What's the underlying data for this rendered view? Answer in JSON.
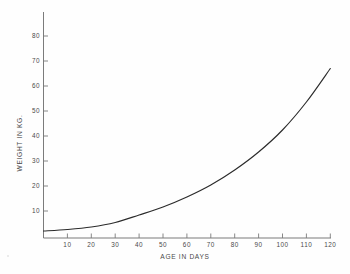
{
  "chart_data": {
    "type": "line",
    "title": "",
    "subtitle": "",
    "xlabel": "AGE IN DAYS",
    "ylabel": "WEIGHT IN KG.",
    "xlim": [
      0,
      125
    ],
    "ylim": [
      0,
      85
    ],
    "xticks": [
      10,
      20,
      30,
      40,
      50,
      60,
      70,
      80,
      90,
      100,
      110,
      120
    ],
    "yticks": [
      10,
      20,
      30,
      40,
      50,
      60,
      70,
      80
    ],
    "xtick_labels": [
      "10",
      "20",
      "30",
      "40",
      "50",
      "60",
      "70",
      "80",
      "90",
      "100",
      "110",
      "120"
    ],
    "ytick_labels": [
      "10",
      "20",
      "30",
      "40",
      "50",
      "60",
      "70",
      "80"
    ],
    "grid": false,
    "legend": false,
    "legend_position": "none",
    "series": [
      {
        "name": "growth curve",
        "color": "#2b2b2b",
        "x": [
          0,
          10,
          20,
          30,
          40,
          50,
          60,
          70,
          80,
          90,
          100,
          110,
          120
        ],
        "y": [
          2.0,
          2.6,
          3.6,
          5.4,
          8.4,
          11.6,
          15.6,
          20.4,
          26.4,
          33.6,
          42.4,
          53.6,
          67.0
        ]
      }
    ]
  },
  "axes": {
    "x_axis_title": "AGE IN DAYS",
    "y_axis_title": "WEIGHT IN KG."
  }
}
